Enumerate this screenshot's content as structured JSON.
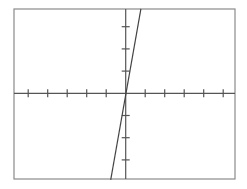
{
  "chart_data": {
    "type": "line",
    "title": "",
    "xlabel": "",
    "ylabel": "",
    "xlim": [
      -5.7,
      5.6
    ],
    "ylim": [
      -3.9,
      3.8
    ],
    "x_ticks": [
      -5,
      -4,
      -3,
      -2,
      -1,
      1,
      2,
      3,
      4,
      5
    ],
    "y_ticks": [
      -3,
      -2,
      -1,
      1,
      2,
      3
    ],
    "tick_labels_visible": false,
    "grid": false,
    "legend": null,
    "series": [
      {
        "name": "y = 5x",
        "slope": 5,
        "intercept": 0,
        "x": [
          -0.77,
          0.78
        ],
        "y": [
          -3.9,
          3.8
        ]
      }
    ]
  },
  "layout": {
    "frame": {
      "left": 14,
      "top": 9,
      "right": 235,
      "bottom": 179
    },
    "origin": {
      "x": 125.7,
      "y": 93.3
    },
    "x_unit_px": 19.5,
    "y_unit_px": 22.2,
    "tick_half_len": 4,
    "colors": {
      "frame": "#8a8a8a",
      "axis": "#555555",
      "line": "#444444"
    }
  }
}
